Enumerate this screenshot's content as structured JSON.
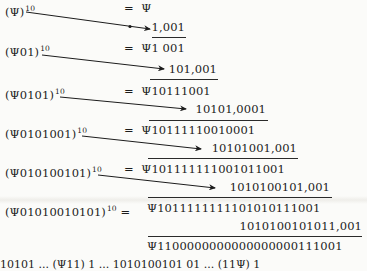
{
  "symbol": "Ψ",
  "exponent": "10",
  "equals": "=",
  "rows": [
    {
      "base": "(Ψ)",
      "result": "Ψ",
      "addend": "1,001"
    },
    {
      "base": "(Ψ01)",
      "result": "Ψ1 001",
      "addend": "101,001"
    },
    {
      "base": "(Ψ0101)",
      "result": "Ψ10111001",
      "addend": "10101,0001"
    },
    {
      "base": "(Ψ0101001)",
      "result": "Ψ10111110010001",
      "addend": "10101001,001"
    },
    {
      "base": "(Ψ010100101)",
      "result": "Ψ101111111001011001",
      "addend": "1010100101,001"
    },
    {
      "base": "(Ψ01010010101)",
      "result": "Ψ1011111111101010111001",
      "addend": "1010100101011,001"
    }
  ],
  "final_sum": "Ψ1100000000000000000111001",
  "cut_off_line": "10101 ...   (Ψ11) 1   ...   1010100101 01 ...   (11Ψ) 1"
}
